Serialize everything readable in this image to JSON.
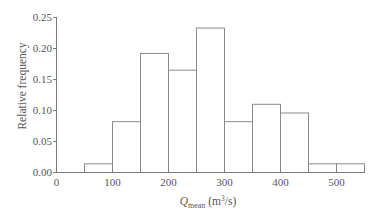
{
  "chart_data": {
    "type": "bar",
    "subtype": "histogram",
    "title": "",
    "xlabel": "Q_mean (m^3/s)",
    "xlabel_parts": {
      "main": "Q",
      "sub": "mean",
      "units_prefix": " (m",
      "sup": "3",
      "units_suffix": "/s)"
    },
    "ylabel": "Relative frequency",
    "xlim": [
      0,
      550
    ],
    "ylim": [
      0,
      0.25
    ],
    "x_ticks": [
      0,
      100,
      200,
      300,
      400,
      500
    ],
    "x_tick_labels": [
      "0",
      "100",
      "200",
      "300",
      "400",
      "500"
    ],
    "y_ticks": [
      0,
      0.05,
      0.1,
      0.15,
      0.2,
      0.25
    ],
    "y_tick_labels": [
      "0.00",
      "0.05",
      "0.10",
      "0.15",
      "0.20",
      "0.25"
    ],
    "grid": false,
    "legend": null,
    "bin_width": 50,
    "categories": [
      "50-100",
      "100-150",
      "150-200",
      "200-250",
      "250-300",
      "300-350",
      "350-400",
      "400-450",
      "450-500",
      "500-550"
    ],
    "bins": [
      {
        "x0": 50,
        "x1": 100,
        "value": 0.014
      },
      {
        "x0": 100,
        "x1": 150,
        "value": 0.082
      },
      {
        "x0": 150,
        "x1": 200,
        "value": 0.192
      },
      {
        "x0": 200,
        "x1": 250,
        "value": 0.165
      },
      {
        "x0": 250,
        "x1": 300,
        "value": 0.233
      },
      {
        "x0": 300,
        "x1": 350,
        "value": 0.082
      },
      {
        "x0": 350,
        "x1": 400,
        "value": 0.11
      },
      {
        "x0": 400,
        "x1": 450,
        "value": 0.096
      },
      {
        "x0": 450,
        "x1": 500,
        "value": 0.014
      },
      {
        "x0": 500,
        "x1": 550,
        "value": 0.014
      }
    ],
    "values": [
      0.014,
      0.082,
      0.192,
      0.165,
      0.233,
      0.082,
      0.11,
      0.096,
      0.014,
      0.014
    ]
  }
}
